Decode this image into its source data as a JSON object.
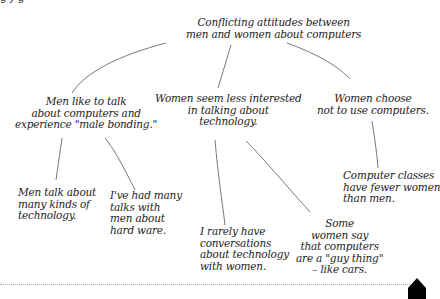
{
  "diagram": {
    "type": "mind-map",
    "top_cut_text": "g                         y               g",
    "root": {
      "id": "root",
      "text": "Conflicting attitudes between\nmen and women about computers"
    },
    "branches": [
      {
        "id": "men-bonding",
        "text": "Men like to talk\nabout computers and\nexperience \"male bonding.\"",
        "children": [
          {
            "id": "men-kinds",
            "text": "Men talk about\nmany kinds of\ntechnology."
          },
          {
            "id": "talks-hardware",
            "text": "I've had many\ntalks with\nmen about\nhard ware."
          }
        ]
      },
      {
        "id": "women-less",
        "text": "Women seem less interested\nin talking about\ntechnology.",
        "children": [
          {
            "id": "rarely",
            "text": "I rarely have\nconversations\nabout technology\nwith women."
          },
          {
            "id": "guy-thing",
            "text": "Some\nwomen say\nthat computers\nare a \"guy thing\"\n– like cars."
          }
        ]
      },
      {
        "id": "women-choose",
        "text": "Women choose\nnot to use computers.",
        "children": [
          {
            "id": "classes",
            "text": "Computer classes\nhave fewer women\nthan men."
          }
        ]
      }
    ]
  },
  "colors": {
    "background": "#ffffff",
    "text": "#1d1d1d",
    "line": "#555555",
    "divider": "#a8a8a8",
    "marker": "#000000"
  }
}
